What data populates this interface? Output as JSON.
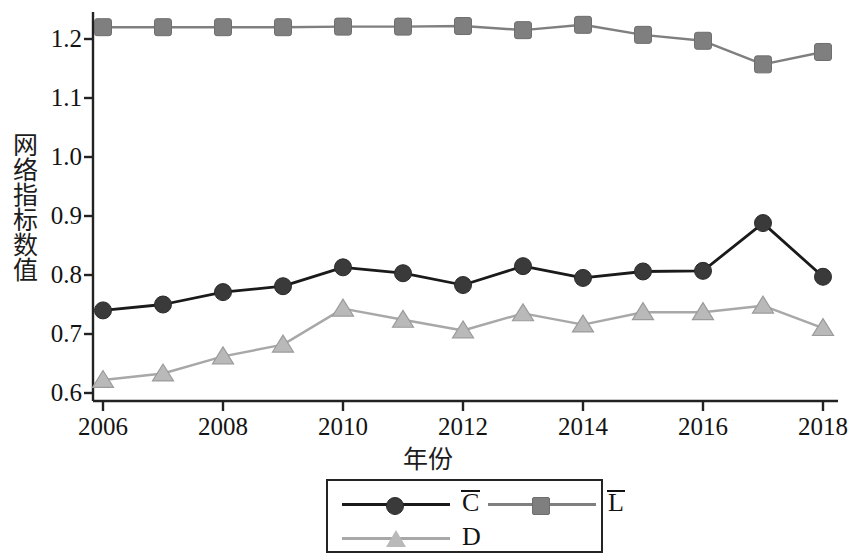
{
  "chart_data": {
    "type": "line",
    "title": "",
    "xlabel": "年份",
    "ylabel": "网络指标数值",
    "x": [
      2006,
      2007,
      2008,
      2009,
      2010,
      2011,
      2012,
      2013,
      2014,
      2015,
      2016,
      2017,
      2018
    ],
    "xtick_labels": [
      "2006",
      "2008",
      "2010",
      "2012",
      "2014",
      "2016",
      "2018"
    ],
    "ytick_labels": [
      "0.6",
      "0.7",
      "0.8",
      "0.9",
      "1.0",
      "1.1",
      "1.2"
    ],
    "xlim": [
      2006,
      2018
    ],
    "ylim": [
      0.6,
      1.24
    ],
    "grid": false,
    "legend_position": "below-center",
    "series": [
      {
        "name": "C̄",
        "label_base": "C",
        "marker": "circle",
        "color": "#3a3a3a",
        "line_color": "#1a1a1a",
        "values": [
          0.74,
          0.75,
          0.771,
          0.781,
          0.813,
          0.803,
          0.783,
          0.815,
          0.795,
          0.806,
          0.807,
          0.888,
          0.797
        ]
      },
      {
        "name": "L̄",
        "label_base": "L",
        "marker": "square",
        "color": "#7f7f7f",
        "line_color": "#7f7f7f",
        "values": [
          1.22,
          1.22,
          1.22,
          1.22,
          1.221,
          1.221,
          1.222,
          1.215,
          1.224,
          1.207,
          1.197,
          1.157,
          1.178
        ]
      },
      {
        "name": "D",
        "label_base": "D",
        "marker": "triangle",
        "color": "#b9b9b9",
        "line_color": "#a8a8a8",
        "values": [
          0.622,
          0.633,
          0.662,
          0.682,
          0.743,
          0.724,
          0.706,
          0.735,
          0.716,
          0.737,
          0.737,
          0.748,
          0.71
        ]
      }
    ]
  },
  "axes": {
    "y_label": "网络指标数值",
    "x_label": "年份",
    "y_ticks": [
      "1.2",
      "1.1",
      "1.0",
      "0.9",
      "0.8",
      "0.7",
      "0.6"
    ],
    "x_ticks": [
      "2006",
      "2008",
      "2010",
      "2012",
      "2014",
      "2016",
      "2018"
    ]
  },
  "legend": {
    "items": [
      {
        "label": "C",
        "overbar": true,
        "marker": "circle-marker"
      },
      {
        "label": "L",
        "overbar": true,
        "marker": "square-marker"
      },
      {
        "label": "D",
        "overbar": false,
        "marker": "triangle-marker"
      }
    ]
  }
}
